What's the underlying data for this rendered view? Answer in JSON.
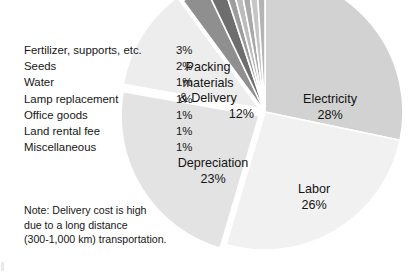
{
  "chart_data": {
    "type": "pie",
    "title": "",
    "legend_position": "left",
    "categories": [
      "Electricity",
      "Labor",
      "Depreciation",
      "Packing materials & Delivery",
      "Fertilizer, supports, etc.",
      "Seeds",
      "Water",
      "Lamp replacement",
      "Office goods",
      "Land rental fee",
      "Miscellaneous"
    ],
    "values": [
      28,
      26,
      23,
      12,
      3,
      2,
      1,
      1,
      1,
      1,
      1
    ],
    "units": "percent",
    "colors": [
      "#d2d2d2",
      "#f1f1f1",
      "#e3e3e3",
      "#ededed",
      "#8f8f8f",
      "#6e6e6e",
      "#9d9d9d",
      "#bcbcbc",
      "#a9a9a9",
      "#c6c6c6",
      "#b4b4b4"
    ],
    "exploded": [
      "Depreciation",
      "Packing materials & Delivery"
    ],
    "labeled_on_chart": [
      "Electricity",
      "Labor",
      "Depreciation",
      "Packing materials & Delivery"
    ]
  },
  "legend": {
    "rows": [
      {
        "label": "Fertilizer, supports, etc.",
        "value": "3%"
      },
      {
        "label": "Seeds",
        "value": "2%"
      },
      {
        "label": "Water",
        "value": "1%"
      },
      {
        "label": "Lamp replacement",
        "value": "1%"
      },
      {
        "label": "Office goods",
        "value": "1%"
      },
      {
        "label": "Land rental fee",
        "value": "1%"
      },
      {
        "label": "Miscellaneous",
        "value": "1%"
      }
    ]
  },
  "note": {
    "lines": [
      "Note: Delivery cost is high",
      "due to a long distance",
      "(300-1,000 km) transportation."
    ]
  },
  "slice_labels": {
    "packing": {
      "line1": "Packing",
      "line2": "materials",
      "line3": "& Delivery",
      "pct": "12%"
    },
    "electricity": {
      "name": "Electricity",
      "pct": "28%"
    },
    "labor": {
      "name": "Labor",
      "pct": "26%"
    },
    "depreciation": {
      "name": "Depreciation",
      "pct": "23%"
    }
  }
}
